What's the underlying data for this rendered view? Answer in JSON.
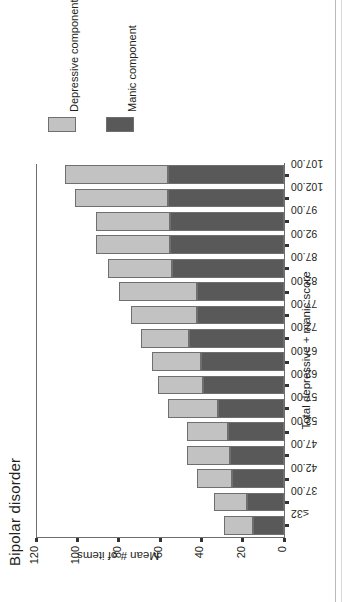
{
  "chart_data": {
    "type": "bar",
    "subtype": "stacked-vertical",
    "title": "Bipolar disorder",
    "xlabel": "Total depressive + manic score",
    "ylabel": "Mean # of items",
    "ylim": [
      0,
      120
    ],
    "yticks": [
      "0",
      "20",
      "40",
      "60",
      "80",
      "100",
      "120"
    ],
    "grid": false,
    "legend_position": "right",
    "orientation_note": "figure printed rotated 90 degrees counter-clockwise",
    "categories": [
      "≤32",
      "37.00",
      "42.00",
      "47.00",
      "52.00",
      "57.00",
      "62.00",
      "67.00",
      "72.00",
      "77.00",
      "82.00",
      "87.00",
      "92.00",
      "97.00",
      "102.00",
      "107.00"
    ],
    "series": [
      {
        "name": "Manic component",
        "color": "#595959",
        "values": [
          15,
          18,
          25,
          26,
          27,
          32,
          39,
          40,
          46,
          42,
          42,
          54,
          55,
          55,
          56,
          56
        ]
      },
      {
        "name": "Depressive component",
        "color": "#c2c2c2",
        "values": [
          14,
          16,
          17,
          21,
          20,
          24,
          22,
          24,
          23,
          32,
          38,
          31,
          36,
          36,
          45,
          50
        ]
      }
    ],
    "totals": [
      29,
      34,
      42,
      47,
      47,
      56,
      61,
      64,
      69,
      74,
      80,
      85,
      91,
      91,
      101,
      106
    ]
  },
  "legend": {
    "items": [
      {
        "label": "Depressive component",
        "color": "#c2c2c2"
      },
      {
        "label": "Manic component",
        "color": "#595959"
      }
    ]
  },
  "axes": {
    "y_title": "Mean # of items",
    "x_title": "Total depressive + manic score"
  },
  "title": "Bipolar disorder"
}
